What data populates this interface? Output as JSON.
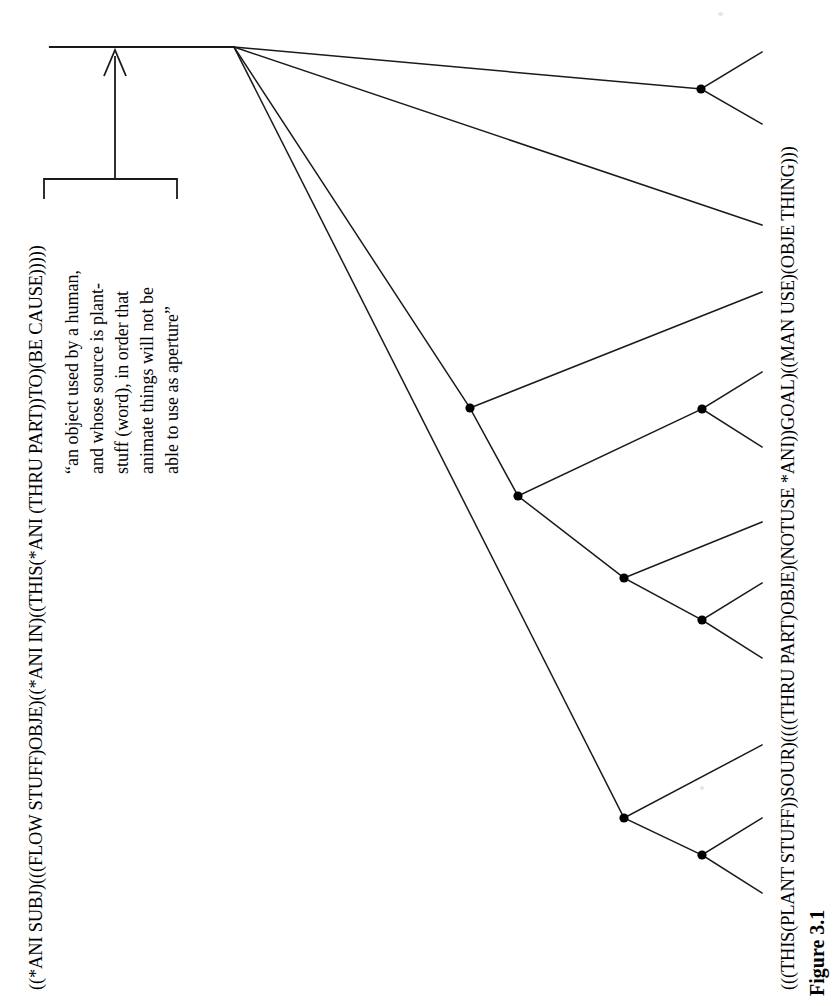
{
  "figure": {
    "caption": "Figure 3.1",
    "canvas": {
      "width": 833,
      "height": 1006
    }
  },
  "formulas": {
    "left": "((*ANI SUBJ)(((FLOW STUFF)OBJE)((*ANI IN)((THIS(*ANI (THRU PART))TO)(BE CAUSE)))))",
    "right": "(((THIS(PLANT STUFF))SOUR)((((THRU PART)OBJE)(NOTUSE *ANI))GOAL)((MAN USE)(OBJE THING)))"
  },
  "gloss": {
    "lines": [
      "“an object used by a human,",
      "and whose source is plant-",
      "stuff (word), in order that",
      "animate things will not be",
      "able to use as aperture”"
    ]
  },
  "tree": {
    "stroke_color": "#1a1a1a",
    "node_color": "#000000",
    "node_radius": 4.6,
    "stem": {
      "x1": 50,
      "y1": 47,
      "x2": 234,
      "y2": 47
    },
    "arrow": {
      "shaft": {
        "x1": 115,
        "y1": 179,
        "x2": 115,
        "y2": 57
      },
      "head": [
        [
          115,
          50
        ],
        [
          104,
          76
        ],
        [
          126,
          76
        ]
      ]
    },
    "bracket": {
      "top_y": 179,
      "left_x": 44,
      "right_x": 177,
      "tick_depth": 20
    },
    "root": {
      "x": 234,
      "y": 47
    },
    "nodes": [
      {
        "id": "n-top",
        "x": 701,
        "y": 89
      },
      {
        "id": "n-mid-a",
        "x": 470,
        "y": 408
      },
      {
        "id": "n-mid-b",
        "x": 702,
        "y": 409
      },
      {
        "id": "n-mid-c",
        "x": 518,
        "y": 496
      },
      {
        "id": "n-mid-d",
        "x": 624,
        "y": 578
      },
      {
        "id": "n-mid-e",
        "x": 702,
        "y": 620
      },
      {
        "id": "n-low-a",
        "x": 624,
        "y": 818
      },
      {
        "id": "n-low-b",
        "x": 702,
        "y": 855
      }
    ],
    "edges": [
      {
        "from": [
          234,
          47
        ],
        "to": [
          701,
          89
        ]
      },
      {
        "from": [
          701,
          89
        ],
        "to": [
          762,
          52
        ]
      },
      {
        "from": [
          701,
          89
        ],
        "to": [
          762,
          124
        ]
      },
      {
        "from": [
          234,
          47
        ],
        "to": [
          762,
          225
        ]
      },
      {
        "from": [
          234,
          47
        ],
        "to": [
          470,
          408
        ]
      },
      {
        "from": [
          470,
          408
        ],
        "to": [
          762,
          292
        ]
      },
      {
        "from": [
          470,
          408
        ],
        "to": [
          518,
          496
        ]
      },
      {
        "from": [
          518,
          496
        ],
        "to": [
          702,
          409
        ]
      },
      {
        "from": [
          702,
          409
        ],
        "to": [
          762,
          372
        ]
      },
      {
        "from": [
          702,
          409
        ],
        "to": [
          762,
          447
        ]
      },
      {
        "from": [
          518,
          496
        ],
        "to": [
          624,
          578
        ]
      },
      {
        "from": [
          624,
          578
        ],
        "to": [
          762,
          522
        ]
      },
      {
        "from": [
          624,
          578
        ],
        "to": [
          702,
          620
        ]
      },
      {
        "from": [
          702,
          620
        ],
        "to": [
          762,
          583
        ]
      },
      {
        "from": [
          702,
          620
        ],
        "to": [
          762,
          658
        ]
      },
      {
        "from": [
          234,
          47
        ],
        "to": [
          624,
          818
        ]
      },
      {
        "from": [
          624,
          818
        ],
        "to": [
          762,
          745
        ]
      },
      {
        "from": [
          624,
          818
        ],
        "to": [
          702,
          855
        ]
      },
      {
        "from": [
          702,
          855
        ],
        "to": [
          762,
          818
        ]
      },
      {
        "from": [
          702,
          855
        ],
        "to": [
          762,
          893
        ]
      }
    ]
  }
}
